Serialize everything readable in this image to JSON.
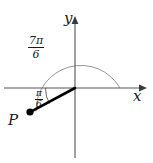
{
  "figure": {
    "background_color": "#ffffff",
    "width": 153,
    "height": 163
  },
  "axes": {
    "x_label": "x",
    "y_label": "y",
    "axis_color": "#555555",
    "origin": {
      "x": 75,
      "y": 88
    },
    "x_axis": {
      "start_x": 4,
      "end_x": 146,
      "y": 88
    },
    "y_axis": {
      "x": 75,
      "start_y": 158,
      "end_y": 16
    }
  },
  "circle": {
    "center_x": 75,
    "center_y": 88,
    "radius": 45,
    "stroke_color": "#8a8a8a",
    "description": "upper-half arc of circle drawn from positive x-axis counterclockwise"
  },
  "angles": {
    "big": {
      "numerator": "7π",
      "denominator": "6",
      "value_label": "7π/6",
      "degrees": 210,
      "arc_stroke": "#8a8a8a"
    },
    "small": {
      "numerator": "π",
      "denominator": "6",
      "value_label": "π/6",
      "degrees": 30,
      "arc_stroke": "#555555"
    }
  },
  "point": {
    "label": "P",
    "x": 30,
    "y": 112,
    "marker_radius": 3.6,
    "marker_color": "#000000"
  },
  "terminal_ray": {
    "from_x": 75,
    "from_y": 88,
    "to_x": 30,
    "to_y": 112,
    "stroke_color": "#000000",
    "stroke_width": 2.6
  }
}
